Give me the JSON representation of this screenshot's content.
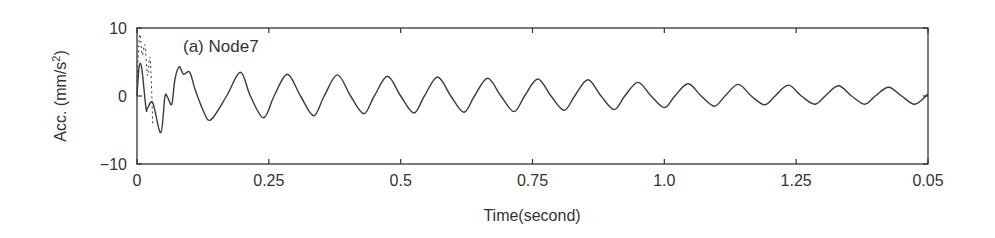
{
  "chart_data": {
    "type": "line",
    "title": "",
    "annotation": "(a) Node7",
    "xlabel": "Time(second)",
    "ylabel": "Acc. (mm/s2)",
    "ylabel_base": "Acc. (mm/s",
    "ylabel_sup": "2",
    "ylabel_close": ")",
    "xlim": [
      0,
      1.5
    ],
    "ylim": [
      -10,
      10
    ],
    "x_ticks": [
      0,
      0.25,
      0.5,
      0.75,
      1.0,
      1.25,
      1.5
    ],
    "x_tick_labels": [
      "0",
      "0.25",
      "0.5",
      "0.75",
      "1.0",
      "1.25",
      "0.05"
    ],
    "y_ticks": [
      10,
      0,
      -10
    ],
    "y_tick_labels": [
      "10",
      "0",
      "−10"
    ],
    "grid": false,
    "legend": null,
    "series": [
      {
        "name": "response (solid)",
        "style": "solid",
        "x": [
          0.0,
          0.004,
          0.009,
          0.017,
          0.02,
          0.03,
          0.045,
          0.053,
          0.058,
          0.066,
          0.072,
          0.08,
          0.088,
          0.1,
          0.11,
          0.126,
          0.14,
          0.17,
          0.196,
          0.215,
          0.24,
          0.26,
          0.285,
          0.31,
          0.335,
          0.355,
          0.38,
          0.405,
          0.43,
          0.45,
          0.475,
          0.5,
          0.525,
          0.545,
          0.57,
          0.595,
          0.62,
          0.64,
          0.665,
          0.69,
          0.715,
          0.735,
          0.76,
          0.785,
          0.81,
          0.83,
          0.855,
          0.88,
          0.905,
          0.925,
          0.95,
          0.975,
          1.0,
          1.02,
          1.045,
          1.07,
          1.095,
          1.115,
          1.14,
          1.165,
          1.19,
          1.21,
          1.235,
          1.26,
          1.285,
          1.305,
          1.33,
          1.355,
          1.38,
          1.4,
          1.425,
          1.45,
          1.475,
          1.5
        ],
        "values": [
          0.0,
          4.3,
          4.1,
          -1.8,
          -1.8,
          -1.0,
          -5.4,
          -0.1,
          -0.2,
          -1.2,
          2.5,
          4.3,
          3.2,
          3.5,
          1.0,
          -2.2,
          -3.5,
          0.0,
          3.5,
          0.0,
          -3.2,
          0.0,
          3.2,
          0.0,
          -2.9,
          0.0,
          3.1,
          0.0,
          -2.6,
          0.0,
          2.9,
          0.0,
          -2.5,
          0.0,
          2.8,
          0.0,
          -2.4,
          0.0,
          2.6,
          0.0,
          -2.3,
          0.0,
          2.5,
          0.0,
          -2.1,
          0.0,
          2.4,
          0.0,
          -2.0,
          0.0,
          2.0,
          0.0,
          -1.7,
          0.0,
          1.8,
          0.0,
          -1.5,
          0.0,
          1.7,
          0.0,
          -1.3,
          0.0,
          1.6,
          0.0,
          -1.2,
          0.0,
          1.5,
          0.0,
          -1.2,
          0.0,
          1.3,
          0.0,
          -1.2,
          0.3
        ]
      },
      {
        "name": "initial transient (dashed)",
        "style": "dashed",
        "x": [
          0.0,
          0.005,
          0.01,
          0.015,
          0.02,
          0.025,
          0.03
        ],
        "values": [
          2.0,
          9.0,
          6.0,
          7.5,
          3.0,
          5.5,
          -4.5
        ]
      }
    ]
  },
  "colors": {
    "line": "#3a3a3a",
    "axis": "#333333",
    "background": "#ffffff"
  }
}
